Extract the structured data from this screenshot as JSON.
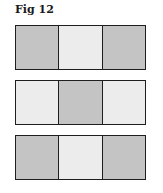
{
  "title": "Fig 12",
  "colors": {
    "dark": "#c4c4c4",
    "light": "#ececec",
    "border": "#1e1e1e"
  },
  "rows": [
    {
      "cells": [
        "dark",
        "light",
        "dark"
      ]
    },
    {
      "cells": [
        "light",
        "dark",
        "light"
      ]
    },
    {
      "cells": [
        "dark",
        "light",
        "dark"
      ]
    }
  ]
}
